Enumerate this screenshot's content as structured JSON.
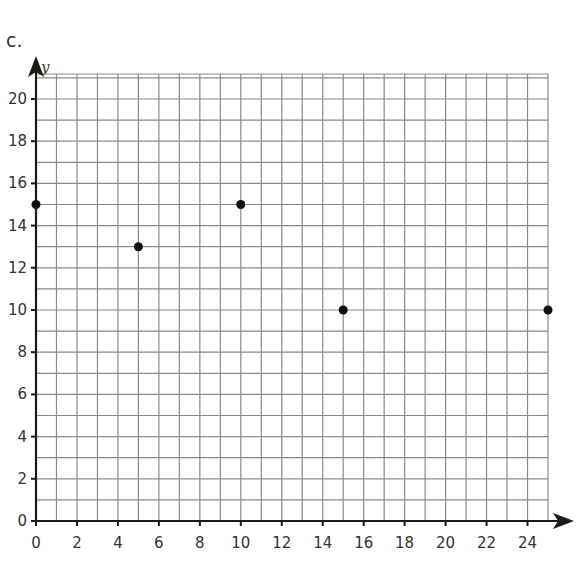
{
  "part_label": "c.",
  "chart_data": {
    "type": "scatter",
    "title": "",
    "xlabel": "",
    "ylabel": "y",
    "xlim": [
      0,
      25
    ],
    "ylim": [
      0,
      21.2
    ],
    "grid": true,
    "grid_step": 1,
    "x_ticks": [
      0,
      2,
      4,
      6,
      8,
      10,
      12,
      14,
      16,
      18,
      20,
      22,
      24
    ],
    "y_ticks": [
      0,
      2,
      4,
      6,
      8,
      10,
      12,
      14,
      16,
      18,
      20
    ],
    "points": [
      {
        "x": 0,
        "y": 15
      },
      {
        "x": 5,
        "y": 13
      },
      {
        "x": 10,
        "y": 15
      },
      {
        "x": 15,
        "y": 10
      },
      {
        "x": 25,
        "y": 10
      }
    ],
    "colors": {
      "grid": "#8a8a8a",
      "axis": "#1a1a1a",
      "point": "#111111"
    }
  }
}
